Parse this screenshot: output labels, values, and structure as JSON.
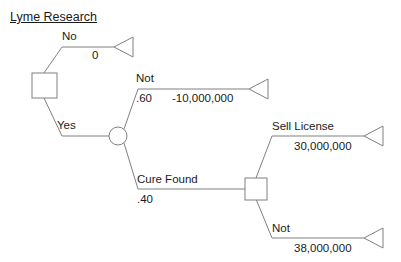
{
  "title": "Lyme Research",
  "colors": {
    "stroke": "#808080",
    "text": "#1a1a1a",
    "background": "#ffffff",
    "node_fill": "#ffffff"
  },
  "nodes": {
    "root_decision": {
      "name": "decision-node-research",
      "shape": "square",
      "x": 44,
      "y": 85
    },
    "chance": {
      "name": "chance-node-outcome",
      "shape": "circle",
      "x": 118,
      "y": 136
    },
    "second_decision": {
      "name": "decision-node-commercialize",
      "shape": "square",
      "x": 256,
      "y": 189
    }
  },
  "branches": [
    {
      "id": "no",
      "label": "No",
      "probability": "",
      "payoff": "0",
      "terminal": true
    },
    {
      "id": "yes",
      "label": "Yes",
      "probability": "",
      "payoff": "",
      "terminal": false
    },
    {
      "id": "not-cure",
      "label": "Not",
      "probability": ".60",
      "payoff": "-10,000,000",
      "terminal": true
    },
    {
      "id": "cure-found",
      "label": "Cure Found",
      "probability": ".40",
      "payoff": "",
      "terminal": false
    },
    {
      "id": "sell-license",
      "label": "Sell License",
      "probability": "",
      "payoff": "30,000,000",
      "terminal": true
    },
    {
      "id": "not-sell",
      "label": "Not",
      "probability": "",
      "payoff": "38,000,000",
      "terminal": true
    }
  ]
}
